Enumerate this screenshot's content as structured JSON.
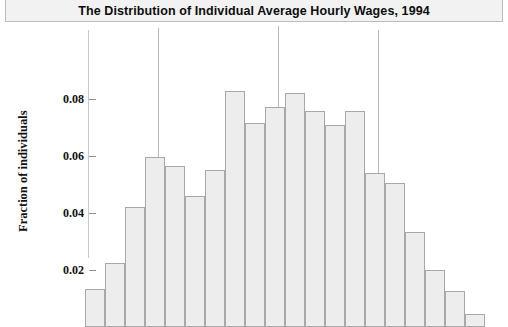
{
  "title": {
    "text": "The Distribution of Individual Average Hourly Wages, 1994"
  },
  "axis": {
    "y_label": "Fraction of  individuals",
    "y_ticks": [
      {
        "value": 0.08,
        "label": "0.08"
      },
      {
        "value": 0.06,
        "label": "0.06"
      },
      {
        "value": 0.04,
        "label": "0.04"
      },
      {
        "value": 0.02,
        "label": "0.02"
      }
    ]
  },
  "colors": {
    "bar_fill": "#ededed",
    "bar_edge": "#a8a8a8",
    "title_bar_bg": "#f2f2f2",
    "title_bar_border": "#bdbdbd",
    "axis": "#c9c9c9",
    "text": "#111111",
    "marker_line": "#b9b9b9"
  },
  "chart_data": {
    "type": "bar",
    "title": "The Distribution of Individual Average Hourly Wages, 1994",
    "xlabel": "",
    "ylabel": "Fraction of individuals",
    "ylim": [
      0,
      0.088
    ],
    "grid": false,
    "legend": null,
    "categories": [
      "bin-1",
      "bin-2",
      "bin-3",
      "bin-4",
      "bin-5",
      "bin-6",
      "bin-7",
      "bin-8",
      "bin-9",
      "bin-10",
      "bin-11",
      "bin-12",
      "bin-13",
      "bin-14",
      "bin-15",
      "bin-16",
      "bin-17",
      "bin-18",
      "bin-19",
      "bin-20"
    ],
    "values": [
      0.0135,
      0.0225,
      0.042,
      0.0598,
      0.0565,
      0.0458,
      0.0552,
      0.0828,
      0.0715,
      0.0772,
      0.0822,
      0.0758,
      0.0708,
      0.0758,
      0.054,
      0.0505,
      0.0335,
      0.02,
      0.0125,
      0.0045
    ],
    "annotations": [
      {
        "type": "vertical-line",
        "bar_index": 3,
        "label": ""
      },
      {
        "type": "vertical-line",
        "bar_index": 9,
        "label": ""
      },
      {
        "type": "vertical-line",
        "bar_index": 14,
        "label": ""
      }
    ]
  },
  "layout": {
    "bar_left_start": 85,
    "bar_width": 20,
    "baseline_y": 327,
    "tick_y_008": 42,
    "px_per_001": 28.5
  }
}
